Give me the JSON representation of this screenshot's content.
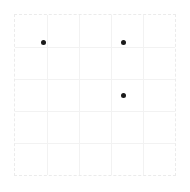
{
  "figure": {
    "background_color": "#ffffff",
    "width": 190,
    "height": 192
  },
  "plot": {
    "background_color": "#ffffff",
    "border_color": "#ebebeb",
    "border_style": "dashed",
    "grid_color": "#f2f2f2",
    "point_color": "#1a1a1a",
    "point_size": 5
  },
  "chart_data": {
    "type": "scatter",
    "title": "",
    "subtitle": "",
    "xlabel": "",
    "ylabel": "",
    "xlim": [
      0,
      5
    ],
    "ylim": [
      0,
      5
    ],
    "grid": true,
    "legend": null,
    "legend_position": "none",
    "xticks": [
      0,
      1,
      2,
      3,
      4,
      5
    ],
    "yticks": [
      0,
      1,
      2,
      3,
      4,
      5
    ],
    "xticklabels": [
      "",
      "",
      "",
      "",
      "",
      ""
    ],
    "yticklabels": [
      "",
      "",
      "",
      "",
      "",
      ""
    ],
    "marker": "circle",
    "marker_color": "#1a1a1a",
    "series": [
      {
        "name": "points",
        "points": [
          {
            "x": 0.88,
            "y": 4.13
          },
          {
            "x": 3.4,
            "y": 4.13
          },
          {
            "x": 3.4,
            "y": 2.47
          }
        ]
      }
    ]
  }
}
